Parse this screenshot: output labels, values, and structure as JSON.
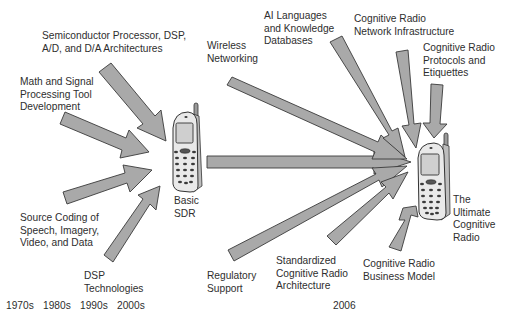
{
  "diagram": {
    "type": "convergence-timeline",
    "colors": {
      "arrow_fill": "#a9a9a9",
      "arrow_stroke": "#3a3a3a",
      "text": "#2e2e2e",
      "background": "#ffffff"
    },
    "left_inputs": [
      {
        "id": "semiconductor",
        "lines": [
          "Semiconductor Processor, DSP,",
          "A/D, and D/A Architectures"
        ]
      },
      {
        "id": "math",
        "lines": [
          "Math and Signal",
          "Processing Tool",
          "Development"
        ]
      },
      {
        "id": "source-coding",
        "lines": [
          "Source Coding of",
          "Speech, Imagery,",
          "Video, and Data"
        ]
      },
      {
        "id": "dsp",
        "lines": [
          "DSP",
          "Technologies"
        ]
      }
    ],
    "basic_sdr": {
      "lines": [
        "Basic",
        "SDR"
      ]
    },
    "right_inputs": [
      {
        "id": "wireless",
        "lines": [
          "Wireless",
          "Networking"
        ]
      },
      {
        "id": "ai",
        "lines": [
          "AI Languages",
          "and Knowledge",
          "Databases"
        ]
      },
      {
        "id": "network-infra",
        "lines": [
          "Cognitive Radio",
          "Network Infrastructure"
        ]
      },
      {
        "id": "protocols",
        "lines": [
          "Cognitive Radio",
          "Protocols and",
          "Etiquettes"
        ]
      },
      {
        "id": "regulatory",
        "lines": [
          "Regulatory",
          "Support"
        ]
      },
      {
        "id": "standardized",
        "lines": [
          "Standardized",
          "Cognitive Radio",
          "Architecture"
        ]
      },
      {
        "id": "business",
        "lines": [
          "Cognitive Radio",
          "Business Model"
        ]
      }
    ],
    "ultimate": {
      "lines": [
        "The",
        "Ultimate",
        "Cognitive",
        "Radio"
      ]
    },
    "timeline": {
      "left": [
        "1970s",
        "1980s",
        "1990s",
        "2000s"
      ],
      "right": "2006"
    }
  }
}
